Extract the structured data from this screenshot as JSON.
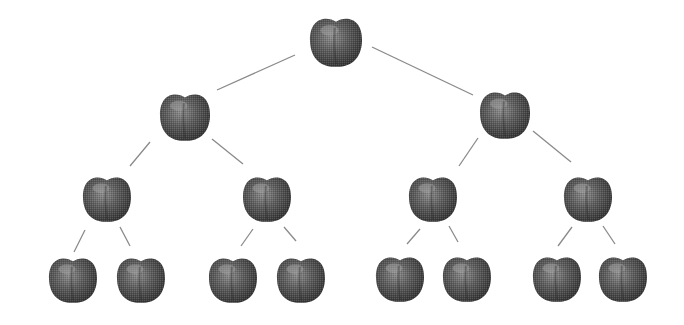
{
  "diagram": {
    "type": "binary-tree",
    "node_icon": "apple-icon",
    "colors": {
      "background": "#ffffff",
      "edge": "#8a8a8a",
      "apple_dark": "#3a3a3a",
      "apple_mid": "#6e6e6e",
      "apple_light": "#9a9a9a"
    },
    "nodes": [
      {
        "id": "n1",
        "level": 1,
        "cx": 336,
        "cy": 42,
        "r": 26
      },
      {
        "id": "n2",
        "level": 2,
        "cx": 185,
        "cy": 117,
        "r": 25
      },
      {
        "id": "n3",
        "level": 2,
        "cx": 505,
        "cy": 115,
        "r": 25
      },
      {
        "id": "n4",
        "level": 3,
        "cx": 107,
        "cy": 199,
        "r": 24
      },
      {
        "id": "n5",
        "level": 3,
        "cx": 267,
        "cy": 199,
        "r": 24
      },
      {
        "id": "n6",
        "level": 3,
        "cx": 433,
        "cy": 199,
        "r": 24
      },
      {
        "id": "n7",
        "level": 3,
        "cx": 588,
        "cy": 199,
        "r": 24
      },
      {
        "id": "n8",
        "level": 4,
        "cx": 73,
        "cy": 280,
        "r": 24
      },
      {
        "id": "n9",
        "level": 4,
        "cx": 141,
        "cy": 280,
        "r": 24
      },
      {
        "id": "n10",
        "level": 4,
        "cx": 233,
        "cy": 280,
        "r": 24
      },
      {
        "id": "n11",
        "level": 4,
        "cx": 301,
        "cy": 280,
        "r": 24
      },
      {
        "id": "n12",
        "level": 4,
        "cx": 400,
        "cy": 279,
        "r": 24
      },
      {
        "id": "n13",
        "level": 4,
        "cx": 467,
        "cy": 279,
        "r": 24
      },
      {
        "id": "n14",
        "level": 4,
        "cx": 557,
        "cy": 279,
        "r": 24
      },
      {
        "id": "n15",
        "level": 4,
        "cx": 623,
        "cy": 279,
        "r": 24
      }
    ],
    "edges": [
      {
        "from": "n1",
        "to": "n2",
        "x1": 295,
        "y1": 55,
        "x2": 217,
        "y2": 90
      },
      {
        "from": "n1",
        "to": "n3",
        "x1": 372,
        "y1": 47,
        "x2": 473,
        "y2": 95
      },
      {
        "from": "n2",
        "to": "n4",
        "x1": 150,
        "y1": 142,
        "x2": 130,
        "y2": 166
      },
      {
        "from": "n2",
        "to": "n5",
        "x1": 212,
        "y1": 139,
        "x2": 243,
        "y2": 164
      },
      {
        "from": "n3",
        "to": "n6",
        "x1": 478,
        "y1": 138,
        "x2": 459,
        "y2": 166
      },
      {
        "from": "n3",
        "to": "n7",
        "x1": 533,
        "y1": 131,
        "x2": 571,
        "y2": 162
      },
      {
        "from": "n4",
        "to": "n8",
        "x1": 85,
        "y1": 230,
        "x2": 74,
        "y2": 252
      },
      {
        "from": "n4",
        "to": "n9",
        "x1": 120,
        "y1": 227,
        "x2": 130,
        "y2": 246
      },
      {
        "from": "n5",
        "to": "n10",
        "x1": 253,
        "y1": 229,
        "x2": 241,
        "y2": 246
      },
      {
        "from": "n5",
        "to": "n11",
        "x1": 284,
        "y1": 227,
        "x2": 296,
        "y2": 241
      },
      {
        "from": "n6",
        "to": "n12",
        "x1": 420,
        "y1": 229,
        "x2": 407,
        "y2": 244
      },
      {
        "from": "n6",
        "to": "n13",
        "x1": 449,
        "y1": 226,
        "x2": 458,
        "y2": 242
      },
      {
        "from": "n7",
        "to": "n14",
        "x1": 572,
        "y1": 227,
        "x2": 558,
        "y2": 246
      },
      {
        "from": "n7",
        "to": "n15",
        "x1": 603,
        "y1": 226,
        "x2": 615,
        "y2": 244
      }
    ]
  }
}
